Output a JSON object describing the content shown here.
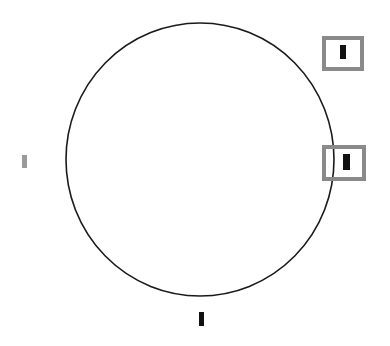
{
  "figure": {
    "background_color": "#ffffff",
    "width": 390,
    "height": 346,
    "caption": ""
  },
  "circle": {
    "name": "large-circle",
    "stroke_color": "#1a1a1a",
    "stroke_width": 1.6,
    "fill": "none",
    "center_x": 200,
    "center_y": 159.5,
    "radius_x": 134,
    "radius_y": 136.5
  },
  "annotation_boxes": [
    {
      "id": "box-upper-right",
      "label": "",
      "border_color": "#8a8a8a",
      "border_width": 4,
      "fill_color": "#ffffff",
      "x": 322,
      "y": 36,
      "width": 42,
      "height": 35,
      "mark": {
        "color": "#111111",
        "x": 340,
        "y": 45,
        "width": 6,
        "height": 14
      }
    },
    {
      "id": "box-mid-right",
      "label": "",
      "border_color": "#8a8a8a",
      "border_width": 4,
      "fill_color": "#ffffff",
      "x": 322,
      "y": 145,
      "width": 44,
      "height": 36,
      "mark": {
        "color": "#111111",
        "x": 343,
        "y": 154,
        "width": 7,
        "height": 16
      }
    }
  ],
  "loose_marks": [
    {
      "id": "mark-left",
      "color": "#9a9a9a",
      "x": 22,
      "y": 155,
      "width": 5,
      "height": 13
    },
    {
      "id": "mark-bottom",
      "color": "#111111",
      "x": 199,
      "y": 312,
      "width": 5,
      "height": 14
    }
  ]
}
